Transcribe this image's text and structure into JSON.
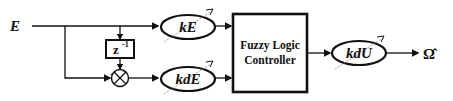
{
  "diagram": {
    "type": "block-diagram",
    "input": {
      "label": "E"
    },
    "delay": {
      "label": "z",
      "superscript": "-1"
    },
    "sum_junction": {
      "signs": {
        "left": "+",
        "top": "−"
      }
    },
    "gains": [
      {
        "id": "kE",
        "label": "kE"
      },
      {
        "id": "kdE",
        "label": "kdE"
      },
      {
        "id": "kdU",
        "label": "kdU"
      }
    ],
    "controller": {
      "line1": "Fuzzy Logic",
      "line2": "Controller"
    },
    "output": {
      "label": "Ω̂"
    }
  },
  "colors": {
    "stroke": "#111111",
    "dashed": "#888888",
    "background": "#ffffff"
  }
}
